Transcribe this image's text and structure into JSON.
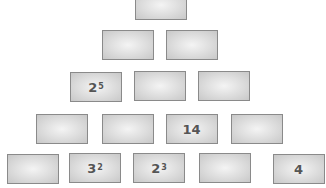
{
  "rows": [
    [
      {
        "base": "",
        "exp": ""
      }
    ],
    [
      {
        "base": "",
        "exp": ""
      },
      {
        "base": "",
        "exp": ""
      }
    ],
    [
      {
        "base": "2",
        "exp": "5"
      },
      {
        "base": "",
        "exp": ""
      },
      {
        "base": "",
        "exp": ""
      }
    ],
    [
      {
        "base": "",
        "exp": ""
      },
      {
        "base": "",
        "exp": ""
      },
      {
        "base": "14",
        "exp": ""
      },
      {
        "base": "",
        "exp": ""
      }
    ],
    [
      {
        "base": "",
        "exp": ""
      },
      {
        "base": "3",
        "exp": "2"
      },
      {
        "base": "2",
        "exp": "3"
      },
      {
        "base": "",
        "exp": ""
      },
      {
        "base": "4",
        "exp": ""
      }
    ]
  ]
}
